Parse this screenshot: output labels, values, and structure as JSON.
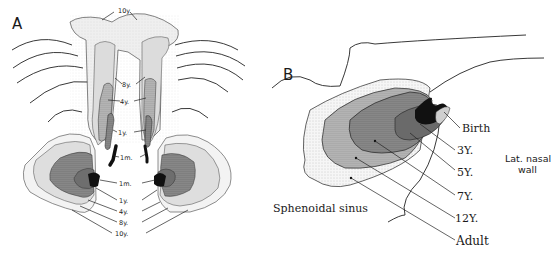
{
  "figure": {
    "panels": [
      {
        "id": "A",
        "label": "A",
        "description": "Frontal view of paranasal sinus growth (frontal and maxillary sinuses) with age contours",
        "frontal_labels": [
          "10y",
          "8y.",
          "4y.",
          "1y.",
          "1m."
        ],
        "maxillary_labels": [
          "1m.",
          "1y.",
          "4y.",
          "8y.",
          "10y."
        ]
      },
      {
        "id": "B",
        "label": "B",
        "description": "Lateral view of sphenoidal sinus growth with age contours",
        "age_labels": [
          "Birth",
          "3Y.",
          "5Y.",
          "7Y.",
          "12Y.",
          "Adult"
        ],
        "structure_labels": {
          "sinus": "Sphenoidal sinus",
          "wall_line1": "Lat. nasal",
          "wall_line2": "wall"
        }
      }
    ],
    "colors": {
      "ink": "#1a1a1a",
      "shade_light": "#ececec",
      "shade_mid": "#d4d4d4",
      "shade_dark": "#a8a8a8",
      "shade_darker": "#6e6e6e",
      "shade_black": "#111111"
    }
  }
}
